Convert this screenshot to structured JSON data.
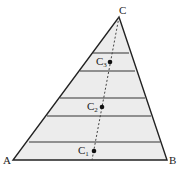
{
  "diagram": {
    "type": "triangle-with-horizontal-bands",
    "vertices": {
      "A": {
        "label": "A",
        "x": 13,
        "y": 160
      },
      "B": {
        "label": "B",
        "x": 167,
        "y": 160
      },
      "C": {
        "label": "C",
        "x": 119,
        "y": 17
      }
    },
    "bands_y": [
      53,
      71,
      98,
      116,
      142
    ],
    "median_line": {
      "style": "dashed",
      "from": [
        119,
        17
      ],
      "to": [
        92,
        160
      ]
    },
    "points": [
      {
        "label": "C",
        "sub": "3",
        "x": 110,
        "y": 62
      },
      {
        "label": "C",
        "sub": "2",
        "x": 102,
        "y": 107
      },
      {
        "label": "C",
        "sub": "1",
        "x": 94,
        "y": 151
      }
    ],
    "colors": {
      "fill": "#ececec",
      "stroke": "#222222"
    }
  }
}
